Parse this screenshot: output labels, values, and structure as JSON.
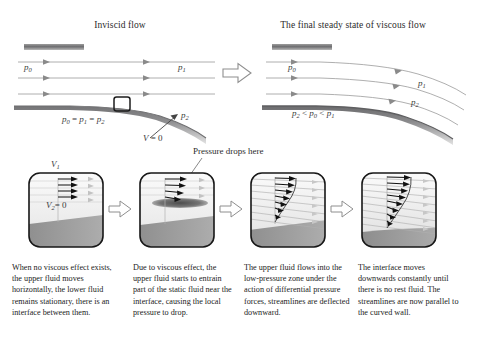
{
  "figure": {
    "domain": "fluid-dynamics-diagram",
    "background_color": "#ffffff"
  },
  "top": {
    "left_panel": {
      "title": "Inviscid flow",
      "upper_pressure_inlet": "p",
      "upper_pressure_inlet_sub": "0",
      "upper_pressure_outlet": "p",
      "upper_pressure_outlet_sub": "1",
      "wall_pressure": "p",
      "wall_pressure_sub": "2",
      "pressure_equation": "p0 = p1 = p2",
      "velocity_label": "V = 0",
      "streamline_count": 3
    },
    "right_panel": {
      "title": "The final steady state of viscous flow",
      "upper_pressure_inlet": "p",
      "upper_pressure_inlet_sub": "0",
      "upper_pressure_outlet": "p",
      "upper_pressure_outlet_sub": "1",
      "wall_pressure": "p",
      "wall_pressure_sub": "2",
      "pressure_inequality": "p2 < p0 < p1",
      "streamline_count": 3
    },
    "transition_arrow": "block-arrow-right"
  },
  "callout": {
    "text": "Pressure drops here",
    "points_to_panel": 2
  },
  "stages": [
    {
      "index": 1,
      "velocity_top_label": "V",
      "velocity_top_sub": "1",
      "velocity_bottom_label": "V",
      "velocity_bottom_sub": "2",
      "velocity_bottom_value": "= 0",
      "caption": "When no viscous effect exists, the upper fluid moves horizontally, the lower fluid remains stationary, there is an interface between them.",
      "arrow_count": 4,
      "profile": "uniform"
    },
    {
      "index": 2,
      "caption": "Due to viscous effect, the upper fluid starts to entrain part of the static fluid near the interface, causing the local pressure to drop.",
      "arrow_count": 4,
      "profile": "entraining",
      "low_pressure_zone": true
    },
    {
      "index": 3,
      "caption": "The upper fluid flows into the low-pressure zone under the action of differential pressure forces, streamlines are deflected downward.",
      "arrow_count": 7,
      "profile": "boundary-layer"
    },
    {
      "index": 4,
      "caption": "The interface moves downwards constantly until there is no rest fluid. The streamlines are now parallel to the curved wall.",
      "arrow_count": 8,
      "profile": "developed-boundary-layer"
    }
  ],
  "stage_arrows": [
    "block-arrow-right",
    "block-arrow-right",
    "block-arrow-right"
  ],
  "colors": {
    "wall_dark": "#58585a",
    "fluid_lower": "#9a9a9a",
    "fluid_upper": "#ededed",
    "streamline": "#8a8a8a",
    "arrow_black": "#111111",
    "panel_border": "#1c1c1c",
    "low_pressure_zone": "#6e6e6e",
    "text": "#232323"
  }
}
